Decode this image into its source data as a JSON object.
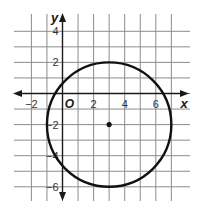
{
  "chart_data": {
    "type": "scatter",
    "title": "",
    "xlabel": "x",
    "ylabel": "y",
    "origin_label": "O",
    "xlim": [
      -3,
      8
    ],
    "ylim": [
      -7,
      5
    ],
    "grid": true,
    "grid_x": [
      -2,
      -1,
      0,
      1,
      2,
      3,
      4,
      5,
      6,
      7
    ],
    "grid_y": [
      -6,
      -5,
      -4,
      -3,
      -2,
      -1,
      0,
      1,
      2,
      3,
      4
    ],
    "x_ticks": [
      {
        "value": -2,
        "label": "−2"
      },
      {
        "value": 2,
        "label": "2"
      },
      {
        "value": 4,
        "label": "4"
      },
      {
        "value": 6,
        "label": "6"
      }
    ],
    "y_ticks": [
      {
        "value": 4,
        "label": "4"
      },
      {
        "value": 2,
        "label": "2"
      },
      {
        "value": -2,
        "label": "−2"
      },
      {
        "value": -4,
        "label": "−4"
      },
      {
        "value": -6,
        "label": "−6"
      }
    ],
    "circle": {
      "center": [
        3,
        -2
      ],
      "radius": 4
    },
    "points": [
      {
        "x": 3,
        "y": -2,
        "label": "center"
      }
    ]
  },
  "colors": {
    "curve": "#111111",
    "grid": "#8c8c8c",
    "axis": "#1a1a1a"
  }
}
